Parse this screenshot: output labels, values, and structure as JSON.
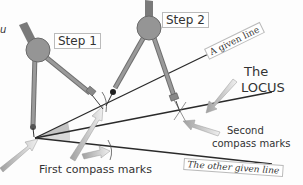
{
  "diagram": {
    "labels": {
      "step1": "Step 1",
      "step2": "Step 2",
      "given_line": "A given line",
      "locus_line1": "The",
      "locus_line2": "LOCUS",
      "second_marks_line1": "Second",
      "second_marks_line2": "compass marks",
      "first_marks": "First compass marks",
      "other_line": "The other given line",
      "edge_fragment": "u"
    },
    "colors": {
      "compass_body": "#8c8c8c",
      "compass_hinge": "#9a9a9a",
      "line": "#2a2a2a",
      "arrow": "#b0b0b0",
      "angle_fill": "#a8a8a8"
    }
  }
}
